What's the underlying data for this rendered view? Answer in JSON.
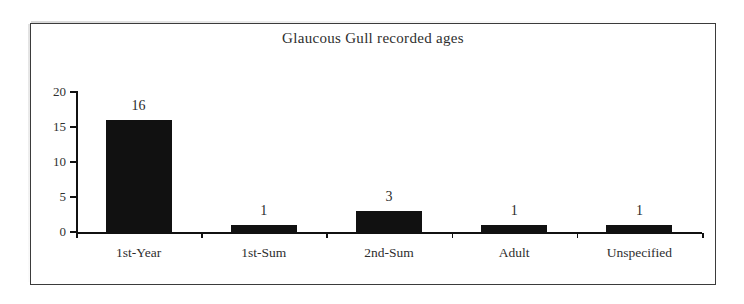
{
  "figure": {
    "title": "Glaucous Gull recorded ages",
    "frame_color": "#3b3b3b",
    "background": "#ffffff",
    "bar_color": "#111111"
  },
  "chart_data": {
    "type": "bar",
    "title": "Glaucous Gull recorded ages",
    "xlabel": "",
    "ylabel": "",
    "categories": [
      "1st-Year",
      "1st-Sum",
      "2nd-Sum",
      "Adult",
      "Unspecified"
    ],
    "values": [
      16,
      1,
      3,
      1,
      1
    ],
    "value_labels": [
      "16",
      "1",
      "3",
      "1",
      "1"
    ],
    "ylim": [
      0,
      20
    ],
    "yticks": [
      0,
      5,
      10,
      15,
      20
    ],
    "ytick_labels": [
      "0",
      "5",
      "10",
      "15",
      "20"
    ],
    "grid": false,
    "legend": null,
    "orientation": "vertical"
  }
}
